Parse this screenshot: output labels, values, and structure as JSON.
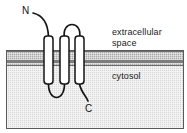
{
  "figure": {
    "type": "diagram"
  },
  "compartments": {
    "extracellular": {
      "label": "extracellular\nspace"
    },
    "cytosol": {
      "label": "cytosol"
    }
  },
  "termini": {
    "n_terminus": "N",
    "c_terminus": "C"
  },
  "protein": {
    "helix_count": 3,
    "helices": [
      {
        "name": "transmembrane-helix-1"
      },
      {
        "name": "transmembrane-helix-2"
      },
      {
        "name": "transmembrane-helix-3"
      }
    ],
    "loops": [
      {
        "name": "cytosolic-loop-1-2"
      },
      {
        "name": "extracellular-loop-2-3"
      }
    ]
  },
  "colors": {
    "membrane_band": "#a9a9a9",
    "membrane_core_line": "#7d7d7d",
    "cytosol_fill": "#d9d9d9",
    "extracellular_fill": "#ffffff",
    "helix_fill": "#ffffff",
    "outline": "#141414",
    "text": "#1a1a1a"
  }
}
